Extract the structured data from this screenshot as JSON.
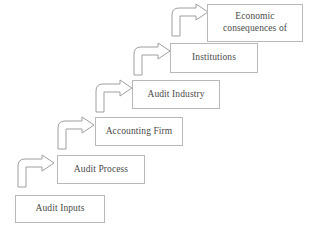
{
  "diagram": {
    "background_color": "#ffffff",
    "box_border_color": "#b9b9b9",
    "arrow_stroke_color": "#9f9f9f",
    "text_color": "#4a4a4a",
    "steps": [
      {
        "label": "Audit Inputs",
        "level": 1,
        "x": 15,
        "y": 195,
        "width": 90,
        "height": 28,
        "has_incoming_arrow": false
      },
      {
        "label": "Audit Process",
        "level": 2,
        "x": 57,
        "y": 155,
        "width": 88,
        "height": 29,
        "has_incoming_arrow": true,
        "arrow": {
          "x": 16,
          "y": 157,
          "width": 40,
          "height": 30
        }
      },
      {
        "label": "Accounting Firm",
        "level": 3,
        "x": 95,
        "y": 117,
        "width": 88,
        "height": 29,
        "has_incoming_arrow": true,
        "arrow": {
          "x": 56,
          "y": 119,
          "width": 40,
          "height": 30
        }
      },
      {
        "label": "Audit Industry",
        "level": 4,
        "x": 132,
        "y": 80,
        "width": 88,
        "height": 29,
        "has_incoming_arrow": true,
        "arrow": {
          "x": 94,
          "y": 82,
          "width": 40,
          "height": 30
        }
      },
      {
        "label": "Institutions",
        "level": 5,
        "x": 170,
        "y": 43,
        "width": 88,
        "height": 30,
        "has_incoming_arrow": true,
        "arrow": {
          "x": 132,
          "y": 45,
          "width": 40,
          "height": 30
        }
      },
      {
        "label": "Economic consequences of",
        "level": 6,
        "x": 207,
        "y": 4,
        "width": 96,
        "height": 38,
        "has_incoming_arrow": true,
        "arrow": {
          "x": 170,
          "y": 6,
          "width": 40,
          "height": 30
        }
      }
    ]
  }
}
